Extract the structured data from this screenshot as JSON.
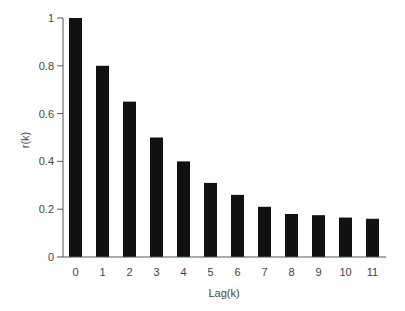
{
  "chart_data": {
    "type": "bar",
    "title": "",
    "xlabel": "Lag(k)",
    "ylabel": "r(k)",
    "categories": [
      "0",
      "1",
      "2",
      "3",
      "4",
      "5",
      "6",
      "7",
      "8",
      "9",
      "10",
      "11"
    ],
    "values": [
      1.0,
      0.8,
      0.65,
      0.5,
      0.4,
      0.31,
      0.26,
      0.21,
      0.18,
      0.175,
      0.165,
      0.16
    ],
    "ylim": [
      0,
      1
    ],
    "yticks": [
      "0",
      "0.2",
      "0.4",
      "0.6",
      "0.8",
      "1"
    ],
    "ytick_values": [
      0,
      0.2,
      0.4,
      0.6,
      0.8,
      1
    ],
    "grid": false,
    "legend": null,
    "bar_color": "#111111"
  }
}
